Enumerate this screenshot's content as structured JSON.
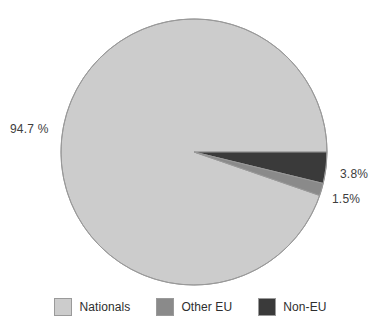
{
  "chart_data": {
    "type": "pie",
    "title": "",
    "categories": [
      "Nationals",
      "Other EU",
      "Non-EU"
    ],
    "values": [
      94.7,
      1.5,
      3.8
    ],
    "units": "percent",
    "colors": {
      "nationals": "#cccccc",
      "other_eu": "#8a8a8a",
      "non_eu": "#3a3a3a",
      "outline": "#999999",
      "text": "#2e2e2e",
      "background": "#ffffff"
    },
    "slice_order_clockwise_from_3oclock": [
      "Non-EU",
      "Other EU",
      "Nationals"
    ],
    "data_labels": [
      {
        "category": "Nationals",
        "text": "94.7 %",
        "position": "left"
      },
      {
        "category": "Non-EU",
        "text": "3.8%",
        "position": "right"
      },
      {
        "category": "Other EU",
        "text": "1.5%",
        "position": "right"
      }
    ],
    "legend": {
      "position": "bottom",
      "entries": [
        {
          "label": "Nationals",
          "color": "#cccccc"
        },
        {
          "label": "Other EU",
          "color": "#8a8a8a"
        },
        {
          "label": "Non-EU",
          "color": "#3a3a3a"
        }
      ]
    },
    "grid": false,
    "xlabel": "",
    "ylabel": ""
  },
  "labels": {
    "nationals_pct": "94.7 %",
    "non_eu_pct": "3.8%",
    "other_eu_pct": "1.5%"
  },
  "legend": {
    "items": [
      {
        "label": "Nationals"
      },
      {
        "label": "Other EU"
      },
      {
        "label": "Non-EU"
      }
    ]
  }
}
